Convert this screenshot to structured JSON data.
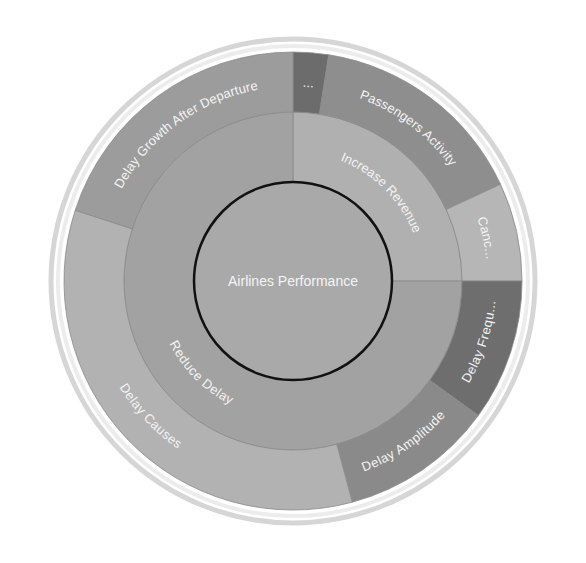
{
  "chart_data": {
    "type": "sunburst",
    "title": "Airlines Performance",
    "center": {
      "label": "Airlines Performance",
      "color": "#a9a9a9"
    },
    "levels": [
      {
        "name": "level-1",
        "segments": [
          {
            "label": "Increase Revenue",
            "start_deg": 0,
            "end_deg": 90,
            "color": "#b0b0b0"
          },
          {
            "label": "Reduce Delay",
            "start_deg": 90,
            "end_deg": 360,
            "color": "#a2a2a2"
          }
        ]
      },
      {
        "name": "level-2",
        "segments": [
          {
            "label": "...",
            "parent": "Increase Revenue",
            "start_deg": 0,
            "end_deg": 9,
            "color": "#6c6c6c"
          },
          {
            "label": "Passengers Activity",
            "parent": "Increase Revenue",
            "start_deg": 9,
            "end_deg": 65,
            "color": "#8e8e8e"
          },
          {
            "label": "Canc...",
            "parent": "Increase Revenue",
            "start_deg": 65,
            "end_deg": 90,
            "color": "#b6b6b6"
          },
          {
            "label": "Delay Frequ...",
            "parent": "Reduce Delay",
            "start_deg": 90,
            "end_deg": 126,
            "color": "#6e6e6e"
          },
          {
            "label": "Delay Amplitude",
            "parent": "Reduce Delay",
            "start_deg": 126,
            "end_deg": 165,
            "color": "#8a8a8a"
          },
          {
            "label": "Delay Causes",
            "parent": "Reduce Delay",
            "start_deg": 165,
            "end_deg": 288,
            "color": "#b2b2b2"
          },
          {
            "label": "Delay Growth After Departure",
            "parent": "Reduce Delay",
            "start_deg": 288,
            "end_deg": 360,
            "color": "#9c9c9c"
          }
        ]
      }
    ],
    "geometry": {
      "cx": 293,
      "cy": 281,
      "r_center": 99,
      "r_mid": 169,
      "r_outer": 229
    },
    "legend": null,
    "grid": false
  }
}
